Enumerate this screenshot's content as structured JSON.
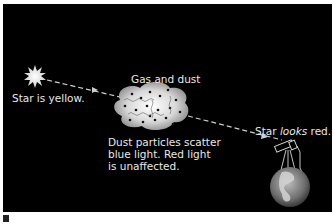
{
  "diagram": {
    "labels": {
      "star_source": "Star is yellow.",
      "cloud": "Gas and dust",
      "scatter_note_line1": "Dust particles scatter",
      "scatter_note_line2": "blue light. Red light",
      "scatter_note_line3": "is unaffected.",
      "observed_prefix": "Star ",
      "observed_emph": "looks",
      "observed_suffix": " red."
    },
    "elements": {
      "star": "star-burst-icon",
      "cloud": "dust-cloud",
      "light_path": "dashed-arrow",
      "telescope": "telescope-icon",
      "earth": "earth-globe"
    },
    "colors": {
      "background": "#000000",
      "text": "#e8e8e8",
      "star": "#f2f2f2",
      "cloud": "#cfcfcf",
      "dust": "#111111"
    }
  }
}
